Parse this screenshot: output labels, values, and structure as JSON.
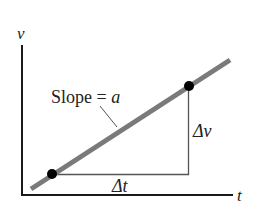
{
  "diagram": {
    "type": "velocity-time graph",
    "y_axis_label": "v",
    "x_axis_label": "t",
    "slope_label_prefix": "Slope = ",
    "slope_label_var": "a",
    "delta_v_label": "Δv",
    "delta_t_label": "Δt",
    "colors": {
      "axis": "#1a1a1a",
      "line": "#7a7a7a",
      "triangle": "#555555",
      "points": "#000000",
      "text": "#222222"
    },
    "points": [
      {
        "name": "lower-point",
        "x": 52,
        "y": 174
      },
      {
        "name": "upper-point",
        "x": 189,
        "y": 86
      }
    ]
  }
}
